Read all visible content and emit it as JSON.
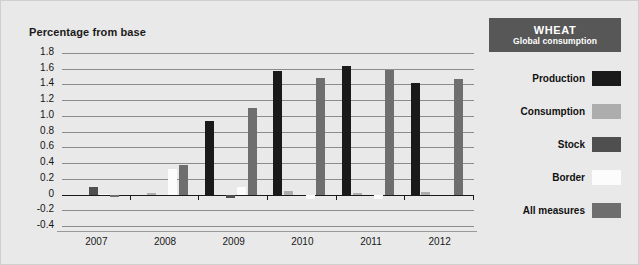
{
  "chart_title": "Percentage from base",
  "legend_panel": {
    "title": "WHEAT",
    "subtitle": "Global consumption",
    "header_bg": "#575757",
    "items": [
      {
        "label": "Production",
        "color": "#1a1a1a"
      },
      {
        "label": "Consumption",
        "color": "#adadad"
      },
      {
        "label": "Stock",
        "color": "#4f4f4f"
      },
      {
        "label": "Border",
        "color": "#fcfcfc"
      },
      {
        "label": "All measures",
        "color": "#6e6e6e"
      }
    ]
  },
  "chart_data": {
    "type": "bar",
    "title": "Percentage from base",
    "xlabel": "",
    "ylabel": "Percentage from base",
    "categories": [
      "2007",
      "2008",
      "2009",
      "2010",
      "2011",
      "2012"
    ],
    "ylim": [
      -0.4,
      1.8
    ],
    "ytick_labels": [
      "1.8",
      "1.6",
      "1.4",
      "1.2",
      "1.0",
      "0.8",
      "0.6",
      "0.4",
      "0.2",
      "0",
      "-0.2",
      "-0.4"
    ],
    "ytick_values": [
      1.8,
      1.6,
      1.4,
      1.2,
      1.0,
      0.8,
      0.6,
      0.4,
      0.2,
      0,
      -0.2,
      -0.4
    ],
    "grid": true,
    "legend_position": "right",
    "series": [
      {
        "name": "Production",
        "color": "#1a1a1a",
        "values": [
          0.0,
          0.0,
          0.93,
          1.57,
          1.63,
          1.42
        ]
      },
      {
        "name": "Consumption",
        "color": "#adadad",
        "values": [
          0.0,
          0.02,
          0.0,
          0.04,
          0.02,
          0.03
        ]
      },
      {
        "name": "Stock",
        "color": "#4f4f4f",
        "values": [
          0.1,
          0.0,
          -0.04,
          0.0,
          0.0,
          0.0
        ]
      },
      {
        "name": "Border",
        "color": "#fcfcfc",
        "values": [
          0.01,
          0.32,
          0.1,
          -0.06,
          -0.06,
          0.0
        ]
      },
      {
        "name": "All measures",
        "color": "#6e6e6e",
        "values": [
          -0.03,
          0.37,
          1.1,
          1.48,
          1.59,
          1.47
        ]
      }
    ]
  },
  "background": "#e9e9e9"
}
